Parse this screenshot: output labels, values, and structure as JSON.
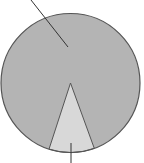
{
  "chart_data": {
    "type": "pie",
    "title": "",
    "categories": [
      "large slice",
      "small slice"
    ],
    "values": [
      89,
      11
    ],
    "labels_visible": false,
    "leader_lines": 2,
    "colors": {
      "background": "#ffffff",
      "large_slice": "#b4b4b4",
      "small_slice": "#d8d8d8",
      "stroke": "#555555",
      "leader": "#333333"
    }
  },
  "geometry": {
    "cx": 70.5,
    "cy": 83,
    "r": 69.5,
    "sector_start_deg": 160,
    "sector_end_deg": 198,
    "leader_top": {
      "x1": 31,
      "y1": 0,
      "x2": 68,
      "y2": 47
    },
    "leader_bottom": {
      "x1": 71,
      "y1": 143,
      "x2": 71,
      "y2": 163
    }
  }
}
